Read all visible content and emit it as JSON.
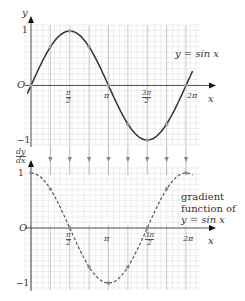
{
  "chart_data": [
    {
      "type": "line",
      "title": "",
      "series": [
        {
          "name": "y = sin x",
          "style": "solid",
          "x": [
            0,
            0.785,
            1.571,
            2.356,
            3.142,
            3.927,
            4.712,
            5.498,
            6.283
          ],
          "values": [
            0,
            0.71,
            1,
            0.71,
            0,
            -0.71,
            -1,
            -0.71,
            0
          ]
        }
      ],
      "xlabel": "x",
      "ylabel": "y",
      "xticks": [
        "π/2",
        "π",
        "3π/2",
        "2π"
      ],
      "yticks": [
        "1",
        "-1"
      ],
      "origin_label": "O",
      "annotation": "y = sin x",
      "grid": true,
      "ylim": [
        -1,
        1
      ]
    },
    {
      "type": "line",
      "title": "",
      "series": [
        {
          "name": "gradient function of y = sin x",
          "style": "dashed",
          "x": [
            0,
            0.785,
            1.571,
            2.356,
            3.142,
            3.927,
            4.712,
            5.498,
            6.283
          ],
          "values": [
            1,
            0.71,
            0,
            -0.71,
            -1,
            -0.71,
            0,
            0.71,
            1
          ]
        }
      ],
      "xlabel": "x",
      "ylabel": "dy/dx",
      "xticks": [
        "π/2",
        "π",
        "3π/2",
        "2π"
      ],
      "yticks": [
        "1",
        "-1"
      ],
      "origin_label": "O",
      "annotation": "gradient function of y = sin x",
      "grid": true,
      "ylim": [
        -1,
        1
      ]
    }
  ],
  "labels": {
    "top_y": "y",
    "top_x": "x",
    "origin": "O",
    "one": "1",
    "minus_one": "−1",
    "curve": "y = sin x",
    "dy": "dy",
    "dx": "dx",
    "ann1": "gradient",
    "ann2": "function of",
    "ann3": "y = sin x",
    "pi_over_2_n": "π",
    "pi_over_2_d": "2",
    "pi": "π",
    "three_pi_over_2_n": "3π",
    "three_pi_over_2_d": "2",
    "two_pi": "2π"
  }
}
